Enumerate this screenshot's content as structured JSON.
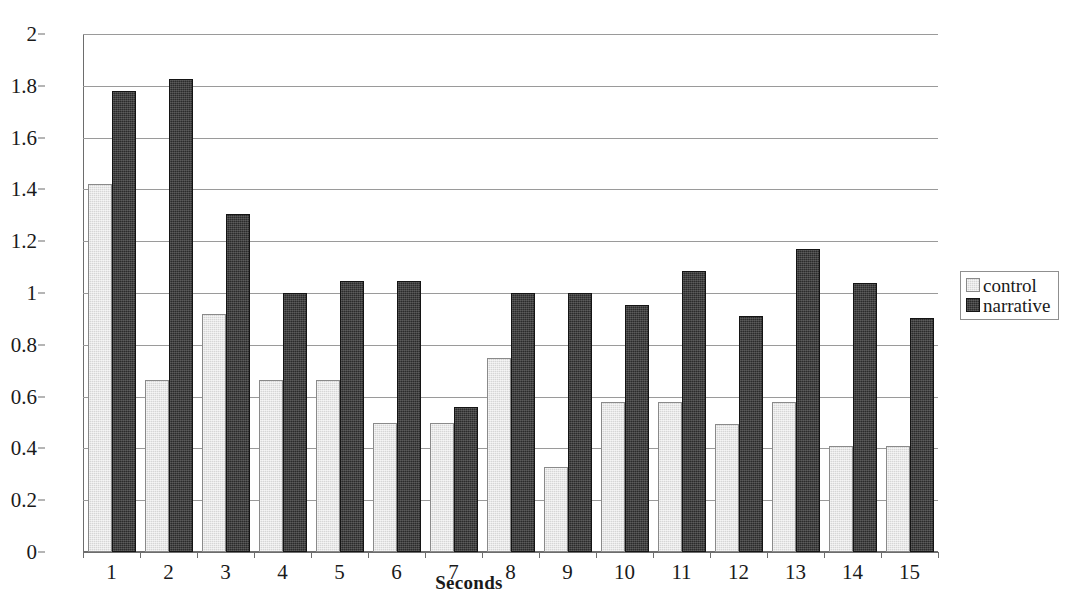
{
  "chart_data": {
    "type": "bar",
    "title": "",
    "xlabel": "Seconds",
    "ylabel": "",
    "categories": [
      "1",
      "2",
      "3",
      "4",
      "5",
      "6",
      "7",
      "8",
      "9",
      "10",
      "11",
      "12",
      "13",
      "14",
      "15"
    ],
    "series": [
      {
        "name": "control",
        "color": "#d6d6d6",
        "values": [
          1.42,
          0.665,
          0.92,
          0.665,
          0.665,
          0.5,
          0.5,
          0.75,
          0.33,
          0.58,
          0.58,
          0.495,
          0.58,
          0.41,
          0.41
        ]
      },
      {
        "name": "narrative",
        "color": "#2b2b2b",
        "values": [
          1.78,
          1.825,
          1.305,
          1.0,
          1.045,
          1.045,
          0.56,
          1.0,
          1.0,
          0.955,
          1.085,
          0.91,
          1.17,
          1.04,
          0.905
        ]
      }
    ],
    "ylim": [
      0,
      2
    ],
    "ytick_labels": [
      "0",
      "0.2",
      "0.4",
      "0.6",
      "0.8",
      "1",
      "1.2",
      "1.4",
      "1.6",
      "1.8",
      "2"
    ],
    "ytick_values": [
      0,
      0.2,
      0.4,
      0.6,
      0.8,
      1,
      1.2,
      1.4,
      1.6,
      1.8,
      2
    ],
    "grid": "horizontal",
    "legend_position": "right",
    "legend_entries": [
      "control",
      "narrative"
    ]
  },
  "axes": {
    "x_title": "Seconds"
  },
  "legend": {
    "control_label": "control",
    "narrative_label": "narrative"
  },
  "artifacts": {
    "top_clipped_caption": ""
  }
}
